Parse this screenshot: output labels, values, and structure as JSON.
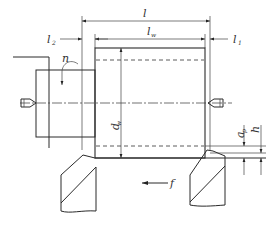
{
  "diagram": {
    "labels": {
      "l": "l",
      "lw": "l",
      "lw_sub": "w",
      "l1": "l",
      "l1_sub": "1",
      "l2": "l",
      "l2_sub": "2",
      "n": "n",
      "dw": "d",
      "dw_sub": "w",
      "ap": "a",
      "ap_sub": "p",
      "h": "h",
      "f": "f"
    },
    "components": [
      "chuck",
      "workpiece",
      "left-center",
      "right-center",
      "left-tool",
      "right-tool",
      "feed-arrow",
      "rotation-arrow"
    ],
    "colors": {
      "line": "#2a2a2a",
      "background": "#ffffff"
    }
  }
}
